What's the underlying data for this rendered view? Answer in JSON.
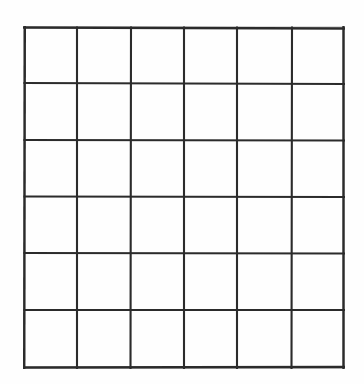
{
  "document": {
    "kind": "blank-grid-worksheet",
    "title": "Blank 6 by 6 grid",
    "description": "An empty hand-ruled table of 6 columns by 6 rows drawn in dark ink on white paper.",
    "background_color": "#ffffff",
    "paper_color": "#fefefe",
    "line_color": "#2b2b2b",
    "line_ghost_color": "#9a9a9a"
  },
  "grid": {
    "columns": 6,
    "rows": 6,
    "total_cells": 36,
    "origin_x": 23,
    "origin_y": 26,
    "width": 322,
    "height": 343,
    "outer_stroke_width": 2.4,
    "inner_stroke_width": 2.1,
    "vertical_line_x": [
      1,
      54,
      108,
      161,
      214,
      269,
      321
    ],
    "horizontal_line_y": [
      1,
      57,
      114,
      170,
      227,
      284,
      342
    ],
    "column_labels": [
      "column-1",
      "column-2",
      "column-3",
      "column-4",
      "column-5",
      "column-6"
    ],
    "row_labels": [
      "row-1",
      "row-2",
      "row-3",
      "row-4",
      "row-5",
      "row-6"
    ],
    "cell_values": [
      [
        "",
        "",
        "",
        "",
        "",
        ""
      ],
      [
        "",
        "",
        "",
        "",
        "",
        ""
      ],
      [
        "",
        "",
        "",
        "",
        "",
        ""
      ],
      [
        "",
        "",
        "",
        "",
        "",
        ""
      ],
      [
        "",
        "",
        "",
        "",
        "",
        ""
      ],
      [
        "",
        "",
        "",
        "",
        "",
        ""
      ]
    ]
  }
}
